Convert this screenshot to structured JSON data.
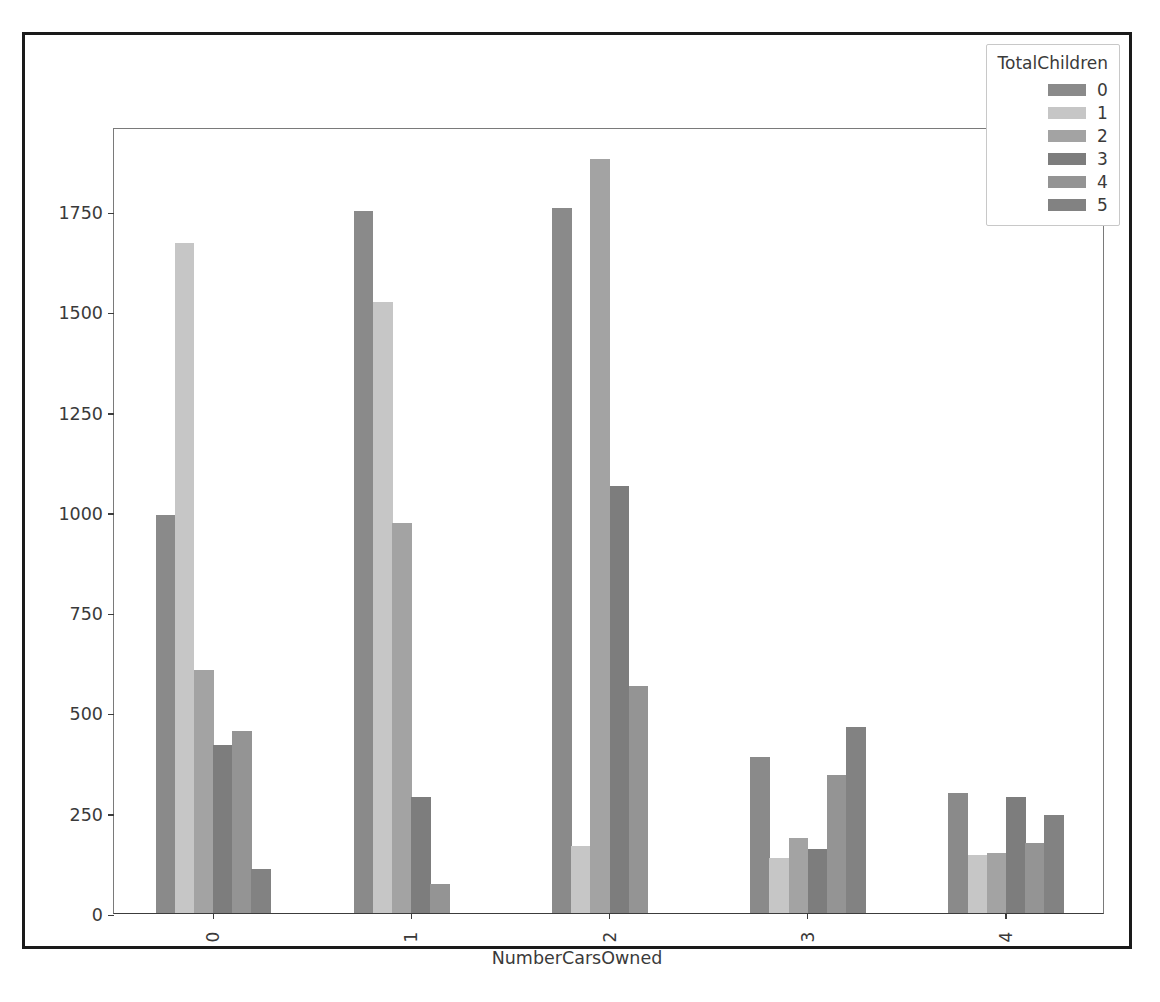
{
  "figure": {
    "background": "#ffffff",
    "frame_color": "#1a1a1a"
  },
  "chart_data": {
    "type": "bar",
    "title": "",
    "subtitle": "",
    "xlabel": "NumberCarsOwned",
    "ylabel": "",
    "categories": [
      "0",
      "1",
      "2",
      "3",
      "4"
    ],
    "xtick_labels": [
      "0",
      "1",
      "2",
      "3",
      "4"
    ],
    "ytick_labels": [
      "0",
      "250",
      "500",
      "750",
      "1000",
      "1250",
      "1500",
      "1750"
    ],
    "ytick_values": [
      0,
      250,
      500,
      750,
      1000,
      1250,
      1500,
      1750
    ],
    "ylim": [
      0,
      1960
    ],
    "grid": false,
    "legend": {
      "title": "TotalChildren",
      "position": "upper right",
      "entries": [
        "0",
        "1",
        "2",
        "3",
        "4",
        "5"
      ]
    },
    "series": [
      {
        "name": "0",
        "color": "#8a8a8a",
        "values": [
          993,
          1751,
          1757,
          390,
          300
        ]
      },
      {
        "name": "1",
        "color": "#c6c6c6",
        "values": [
          1671,
          1524,
          168,
          136,
          145
        ]
      },
      {
        "name": "2",
        "color": "#a3a3a3",
        "values": [
          605,
          973,
          1880,
          188,
          150
        ]
      },
      {
        "name": "3",
        "color": "#7d7d7d",
        "values": [
          418,
          289,
          1065,
          160,
          290
        ]
      },
      {
        "name": "4",
        "color": "#949494",
        "values": [
          453,
          72,
          565,
          345,
          175
        ]
      },
      {
        "name": "5",
        "color": "#828282",
        "values": [
          110,
          0,
          0,
          463,
          245
        ]
      }
    ]
  }
}
